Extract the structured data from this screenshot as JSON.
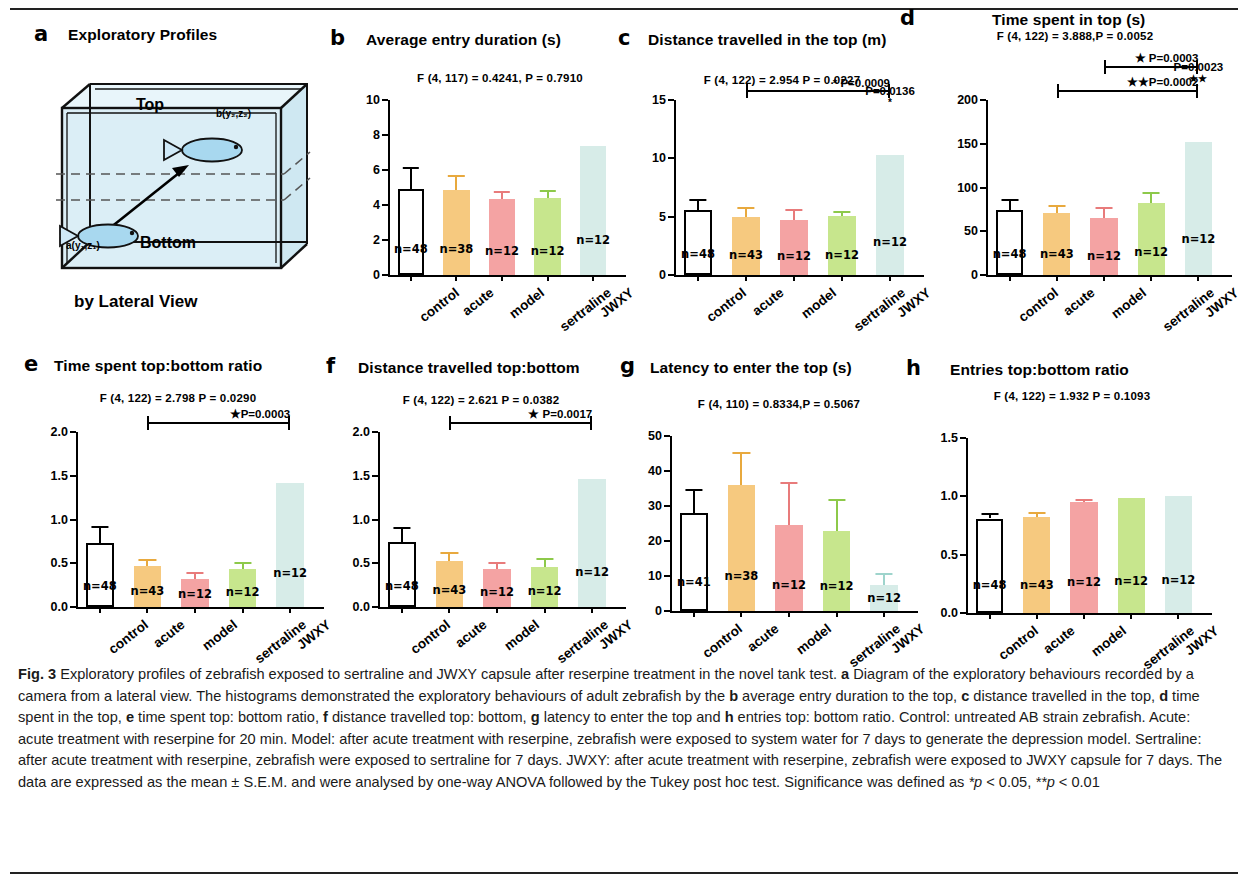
{
  "figure": {
    "label": "Fig. 3",
    "caption_segments": [
      {
        "t": "Fig. 3",
        "b": true
      },
      {
        "t": " Exploratory profiles of zebrafish exposed to sertraline and JWXY capsule after reserpine treatment in the novel tank test. "
      },
      {
        "t": "a",
        "b": true
      },
      {
        "t": " Diagram of the exploratory behaviours recorded by a camera from a lateral view. The histograms demonstrated the exploratory behaviours of adult zebrafish by the "
      },
      {
        "t": "b",
        "b": true
      },
      {
        "t": " average entry duration to the top, "
      },
      {
        "t": "c",
        "b": true
      },
      {
        "t": " distance travelled in the top, "
      },
      {
        "t": "d",
        "b": true
      },
      {
        "t": " time spent in the top, "
      },
      {
        "t": "e",
        "b": true
      },
      {
        "t": " time spent top: bottom ratio, "
      },
      {
        "t": "f",
        "b": true
      },
      {
        "t": " distance travelled top: bottom, "
      },
      {
        "t": "g",
        "b": true
      },
      {
        "t": " latency to enter the top and "
      },
      {
        "t": "h",
        "b": true
      },
      {
        "t": " entries top: bottom ratio. Control: untreated AB strain zebrafish. Acute: acute treatment with reserpine for 20 min. Model: after acute treatment with reserpine, zebrafish were exposed to system water for 7 days to generate the depression model. Sertraline: after acute treatment with reserpine, zebrafish were exposed to sertraline for 7 days. JWXY: after acute treatment with reserpine, zebrafish were exposed to JWXY capsule for 7 days. The data are expressed as the mean ± S.E.M. and were analysed by one-way ANOVA followed by the Tukey post hoc test. Significance was defined as "
      },
      {
        "t": "*p",
        "i": true
      },
      {
        "t": " < 0.05, "
      },
      {
        "t": "**p",
        "i": true
      },
      {
        "t": " < 0.01"
      }
    ]
  },
  "colors": {
    "control": "#ffffff",
    "acute": "#f6c97f",
    "model": "#f4a3a3",
    "sertraline": "#c7e68d",
    "jwxy": "#d7ece8",
    "axis": "#000000",
    "water": "#d9eef5"
  },
  "panel_a": {
    "letter": "a",
    "title": "Exploratory Profiles",
    "footer": "by Lateral View",
    "top_label": "Top",
    "bottom_label": "Bottom",
    "point_b": "b(y₂,z₂)",
    "point_a": "a(y₁,z₁)"
  },
  "categories": [
    "control",
    "acute",
    "model",
    "sertraline",
    "JWXY"
  ],
  "chart_data": [
    {
      "id": "b",
      "type": "bar",
      "letter": "b",
      "title": "Average entry duration  (s)",
      "stats": "F (4, 117) = 0.4241, P = 0.7910",
      "categories": [
        "control",
        "acute",
        "model",
        "sertraline",
        "JWXY"
      ],
      "values": [
        4.9,
        4.88,
        4.35,
        4.42,
        7.35
      ],
      "errors_upper": [
        6.15,
        5.72,
        4.78,
        4.85,
        7.35
      ],
      "n_labels": [
        "n=48",
        "n=38",
        "n=12",
        "n=12",
        "n=12"
      ],
      "ylabel": "",
      "ylim": [
        0,
        10
      ],
      "yticks": [
        0,
        2,
        4,
        6,
        8,
        10
      ],
      "ytick_labels": [
        "0",
        "2",
        "4",
        "6",
        "8",
        "10"
      ],
      "sig_bars": []
    },
    {
      "id": "c",
      "type": "bar",
      "letter": "c",
      "title": "Distance travelled in the top (m)",
      "stats": "F (4, 122) = 2.954  P = 0.0227",
      "categories": [
        "control",
        "acute",
        "model",
        "sertraline",
        "JWXY"
      ],
      "values": [
        5.6,
        5.0,
        4.7,
        5.05,
        10.3
      ],
      "errors_upper": [
        6.5,
        5.8,
        5.7,
        5.5,
        10.3
      ],
      "n_labels": [
        "n=48",
        "n=43",
        "n=12",
        "n=12",
        "n=12"
      ],
      "ylabel": "",
      "ylim": [
        0,
        15
      ],
      "yticks": [
        0,
        5,
        10,
        15
      ],
      "ytick_labels": [
        "0",
        "5",
        "10",
        "15"
      ],
      "sig_bars": [
        {
          "from": 1,
          "to": 4,
          "label": "* P=0.0009"
        }
      ],
      "sig_free": [
        {
          "label": "P=0.0136",
          "star": "*"
        }
      ]
    },
    {
      "id": "d",
      "type": "bar",
      "letter": "d",
      "title": "Time spent in top (s)",
      "stats": "F (4, 122) = 3.888,P = 0.0052",
      "categories": [
        "control",
        "acute",
        "model",
        "sertraline",
        "JWXY"
      ],
      "values": [
        74,
        71,
        65,
        82,
        152
      ],
      "errors_upper": [
        87,
        80,
        78,
        95,
        152
      ],
      "n_labels": [
        "n=48",
        "n=43",
        "n=12",
        "n=12",
        "n=12"
      ],
      "ylabel": "",
      "ylim": [
        0,
        200
      ],
      "yticks": [
        0,
        50,
        100,
        150,
        200
      ],
      "ytick_labels": [
        "0",
        "50",
        "100",
        "150",
        "200"
      ],
      "sig_bars": [
        {
          "from": 1,
          "to": 4,
          "label": "★★P=0.0002"
        },
        {
          "from": 2,
          "to": 4,
          "label": "★ P=0.0003"
        }
      ],
      "sig_free": [
        {
          "label": "P=0.0023",
          "star": "★★"
        }
      ]
    },
    {
      "id": "e",
      "type": "bar",
      "letter": "e",
      "title": "Time spent top:bottom ratio",
      "stats": "F (4, 122) = 2.798   P = 0.0290",
      "categories": [
        "control",
        "acute",
        "model",
        "sertraline",
        "JWXY"
      ],
      "values": [
        0.73,
        0.47,
        0.32,
        0.43,
        1.42
      ],
      "errors_upper": [
        0.93,
        0.55,
        0.4,
        0.51,
        1.42
      ],
      "n_labels": [
        "n=48",
        "n=43",
        "n=12",
        "n=12",
        "n=12"
      ],
      "ylabel": "",
      "ylim": [
        0,
        2.0
      ],
      "yticks": [
        0,
        0.5,
        1.0,
        1.5,
        2.0
      ],
      "ytick_labels": [
        "0.0",
        "0.5",
        "1.0",
        "1.5",
        "2.0"
      ],
      "sig_bars": [
        {
          "from": 1,
          "to": 4,
          "label": "★P=0.0003"
        }
      ],
      "sig_free": []
    },
    {
      "id": "f",
      "type": "bar",
      "letter": "f",
      "title": "Distance travelled top:bottom",
      "stats": "F (4, 122) = 2.621  P = 0.0382",
      "categories": [
        "control",
        "acute",
        "model",
        "sertraline",
        "JWXY"
      ],
      "values": [
        0.74,
        0.53,
        0.44,
        0.46,
        1.46
      ],
      "errors_upper": [
        0.92,
        0.63,
        0.51,
        0.56,
        1.46
      ],
      "n_labels": [
        "n=48",
        "n=43",
        "n=12",
        "n=12",
        "n=12"
      ],
      "ylabel": "",
      "ylim": [
        0,
        2.0
      ],
      "yticks": [
        0,
        0.5,
        1.0,
        1.5,
        2.0
      ],
      "ytick_labels": [
        "0.0",
        "0.5",
        "1.0",
        "1.5",
        "2.0"
      ],
      "sig_bars": [
        {
          "from": 1,
          "to": 4,
          "label": "★ P=0.0017"
        }
      ],
      "sig_free": []
    },
    {
      "id": "g",
      "type": "bar",
      "letter": "g",
      "title": "Latency to enter the top  (s)",
      "stats": "F (4, 110) = 0.8334,P = 0.5067",
      "categories": [
        "control",
        "acute",
        "model",
        "sertraline",
        "JWXY"
      ],
      "values": [
        28,
        36,
        24.5,
        23,
        7.5
      ],
      "errors_upper": [
        35,
        45.5,
        37,
        32,
        11
      ],
      "n_labels": [
        "n=41",
        "n=38",
        "n=12",
        "n=12",
        "n=12"
      ],
      "ylabel": "",
      "ylim": [
        0,
        50
      ],
      "yticks": [
        0,
        10,
        20,
        30,
        40,
        50
      ],
      "ytick_labels": [
        "0",
        "10",
        "20",
        "30",
        "40",
        "50"
      ],
      "sig_bars": [],
      "sig_free": []
    },
    {
      "id": "h",
      "type": "bar",
      "letter": "h",
      "title": "Entries top:bottom ratio",
      "stats": "F (4, 122) = 1.932  P = 0.1093",
      "categories": [
        "control",
        "acute",
        "model",
        "sertraline",
        "JWXY"
      ],
      "values": [
        0.81,
        0.82,
        0.95,
        0.99,
        1.0
      ],
      "errors_upper": [
        0.86,
        0.87,
        0.975,
        0.99,
        1.0
      ],
      "n_labels": [
        "n=48",
        "n=43",
        "n=12",
        "n=12",
        "n=12"
      ],
      "ylabel": "",
      "ylim": [
        0,
        1.5
      ],
      "yticks": [
        0,
        0.5,
        1.0,
        1.5
      ],
      "ytick_labels": [
        "0.0",
        "0.5",
        "1.0",
        "1.5"
      ],
      "sig_bars": [],
      "sig_free": []
    }
  ]
}
